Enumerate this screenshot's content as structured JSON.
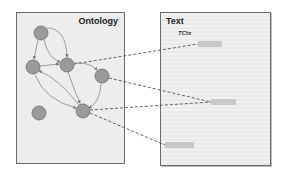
{
  "ontology_panel": {
    "title": "Ontology",
    "nodes": [
      {
        "id": "n1",
        "cx": 41,
        "cy": 33
      },
      {
        "id": "n2",
        "cx": 33,
        "cy": 67
      },
      {
        "id": "n3",
        "cx": 67,
        "cy": 65
      },
      {
        "id": "n4",
        "cx": 102,
        "cy": 76
      },
      {
        "id": "n5",
        "cx": 39,
        "cy": 113
      },
      {
        "id": "n6",
        "cx": 83,
        "cy": 111
      }
    ],
    "edges": [
      {
        "from": "n1",
        "to": "n2"
      },
      {
        "from": "n1",
        "to": "n3"
      },
      {
        "from": "n1",
        "to": "n3",
        "curve": "outer"
      },
      {
        "from": "n2",
        "to": "n3"
      },
      {
        "from": "n3",
        "to": "n4"
      },
      {
        "from": "n3",
        "to": "n6"
      },
      {
        "from": "n2",
        "to": "n6"
      },
      {
        "from": "n6",
        "to": "n2"
      },
      {
        "from": "n4",
        "to": "n6"
      }
    ],
    "node_color": "#9a9a9a"
  },
  "text_panel": {
    "title": "Text",
    "context_label": "TCtx",
    "highlights": [
      {
        "id": "h1",
        "x": 198,
        "y": 41,
        "w": 24
      },
      {
        "id": "h2",
        "x": 211,
        "y": 99,
        "w": 25
      },
      {
        "id": "h3",
        "x": 165,
        "y": 142,
        "w": 29
      }
    ]
  },
  "mappings": [
    {
      "from": "n3",
      "to": "h1"
    },
    {
      "from": "n4",
      "to": "h2"
    },
    {
      "from": "n6",
      "to": "h2"
    },
    {
      "from": "n6",
      "to": "h3"
    }
  ],
  "colors": {
    "panel_bg": "#ededed",
    "border": "#6b6b6b",
    "edge": "#7a7a7a",
    "dashed": "#555555",
    "highlight": "#c9c9c9"
  }
}
